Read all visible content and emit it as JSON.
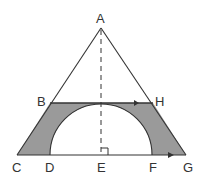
{
  "diagram": {
    "type": "geometry",
    "points": {
      "A": {
        "label": "A",
        "x": 101,
        "y": 28
      },
      "B": {
        "label": "B",
        "x": 50,
        "y": 103
      },
      "H": {
        "label": "H",
        "x": 153,
        "y": 103
      },
      "C": {
        "label": "C",
        "x": 17,
        "y": 155
      },
      "D": {
        "label": "D",
        "x": 50,
        "y": 155
      },
      "E": {
        "label": "E",
        "x": 101,
        "y": 155
      },
      "F": {
        "label": "F",
        "x": 152,
        "y": 155
      },
      "G": {
        "label": "G",
        "x": 186,
        "y": 155
      }
    },
    "labels": {
      "A": "A",
      "B": "B",
      "H": "H",
      "C": "C",
      "D": "D",
      "E": "E",
      "F": "F",
      "G": "G"
    },
    "colors": {
      "line": "#333333",
      "shade": "#9a9a9a",
      "background": "#ffffff"
    },
    "annotations": [
      "parallel arrow on BH",
      "parallel arrow on CG",
      "right angle at E",
      "dashed altitude AE"
    ]
  }
}
